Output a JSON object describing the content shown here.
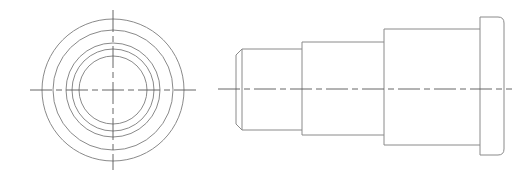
{
  "drawing": {
    "type": "orthographic-technical-drawing",
    "subject": "stepped flanged bushing",
    "colors": {
      "outline": "#8a8a8a",
      "centerline": "#555555",
      "background": "#ffffff"
    },
    "end_view": {
      "center": [
        113,
        90
      ],
      "circle_radii": [
        71,
        60,
        47,
        41,
        34
      ],
      "vertical_centerline": {
        "y1": 10,
        "y2": 170
      },
      "horizontal_centerline": {
        "x1": 30,
        "x2": 196
      }
    },
    "side_view": {
      "centerline": {
        "y": 89,
        "x1": 218,
        "x2": 512
      },
      "sections": [
        {
          "name": "chamfered-tip",
          "x1": 236,
          "x2": 242,
          "top": 49,
          "bottom": 130,
          "chamfer": 6
        },
        {
          "name": "small-shaft",
          "x1": 242,
          "x2": 302,
          "top": 49,
          "bottom": 130
        },
        {
          "name": "middle-shaft",
          "x1": 302,
          "x2": 384,
          "top": 42,
          "bottom": 135
        },
        {
          "name": "large-shaft",
          "x1": 384,
          "x2": 480,
          "top": 29,
          "bottom": 145
        },
        {
          "name": "flange",
          "x1": 480,
          "x2": 504,
          "top": 17,
          "bottom": 155,
          "corner_radius": 6
        }
      ]
    }
  }
}
